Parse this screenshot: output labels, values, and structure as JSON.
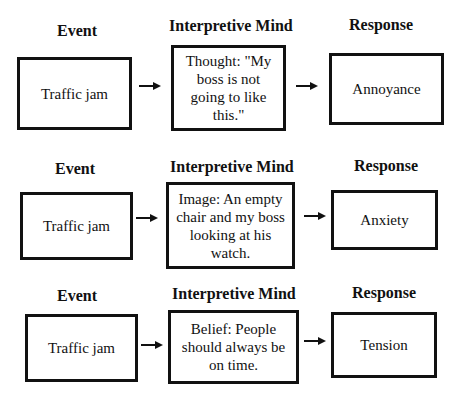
{
  "diagram": {
    "rows": [
      {
        "headers": {
          "event": "Event",
          "mind": "Interpretive Mind",
          "response": "Response"
        },
        "event": "Traffic jam",
        "mind": "Thought: \"My boss is not going to like this.\"",
        "response": "Annoyance"
      },
      {
        "headers": {
          "event": "Event",
          "mind": "Interpretive Mind",
          "response": "Response"
        },
        "event": "Traffic jam",
        "mind": "Image: An empty chair and my boss looking at his watch.",
        "response": "Anxiety"
      },
      {
        "headers": {
          "event": "Event",
          "mind": "Interpretive Mind",
          "response": "Response"
        },
        "event": "Traffic jam",
        "mind": "Belief:  People should always be on time.",
        "response": "Tension"
      }
    ]
  }
}
